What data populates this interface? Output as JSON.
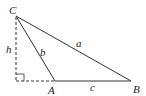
{
  "diagram": {
    "type": "triangle-with-altitude",
    "vertices": {
      "C": {
        "label": "C",
        "x": 16,
        "y": 16
      },
      "A": {
        "label": "A",
        "x": 55,
        "y": 81
      },
      "B": {
        "label": "B",
        "x": 131,
        "y": 81
      }
    },
    "foot": {
      "x": 16,
      "y": 81
    },
    "sides": {
      "a": {
        "label": "a",
        "from": "C",
        "to": "B"
      },
      "b": {
        "label": "b",
        "from": "C",
        "to": "A"
      },
      "c": {
        "label": "c",
        "from": "A",
        "to": "B"
      }
    },
    "altitude": {
      "label": "h",
      "style": "dashed"
    },
    "extension": {
      "style": "dashed",
      "from": "foot",
      "to": "A"
    },
    "right_angle_marker": true,
    "colors": {
      "line": "#333333",
      "background": "#ffffff"
    }
  }
}
